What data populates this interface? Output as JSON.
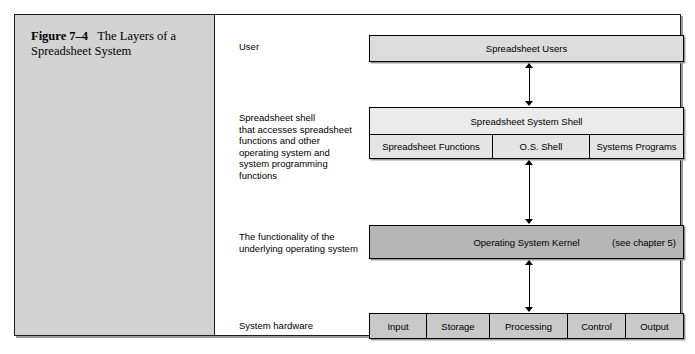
{
  "figure": {
    "label": "Figure 7–4",
    "title": "The Layers of a Spreadsheet System"
  },
  "diagram": {
    "type": "layered-architecture",
    "colors": {
      "caption_panel": "#d3d3d3",
      "user_box": "#dcdcdc",
      "shell_box": "#ebebeb",
      "shell_sub_box": "#e4e4e4",
      "kernel_box": "#b6b6b6",
      "hardware_box": "#c9c9c9",
      "border": "#000000",
      "shadow": "#9a9a9a"
    },
    "layers": [
      {
        "id": "user",
        "side_label": "User",
        "box_label": "Spreadsheet Users",
        "sub_boxes": []
      },
      {
        "id": "shell",
        "side_label": "Spreadsheet shell\nthat accesses spreadsheet\nfunctions and other\noperating system and\nsystem programming\nfunctions",
        "box_label": "Spreadsheet System Shell",
        "sub_boxes": [
          "Spreadsheet Functions",
          "O.S. Shell",
          "Systems Programs"
        ]
      },
      {
        "id": "kernel",
        "side_label": "The functionality of the\nunderlying operating system",
        "box_label": "Operating System Kernel",
        "box_note": "(see chapter 5)",
        "sub_boxes": []
      },
      {
        "id": "hardware",
        "side_label": "System hardware",
        "box_label": "",
        "sub_boxes": [
          "Input",
          "Storage",
          "Processing",
          "Control",
          "Output"
        ]
      }
    ],
    "connectors": [
      {
        "id": "user-shell",
        "from": "user",
        "to": "shell",
        "style": "double-headed-arrow"
      },
      {
        "id": "shell-kernel",
        "from": "shell",
        "to": "kernel",
        "style": "double-headed-arrow"
      },
      {
        "id": "kernel-hardware",
        "from": "kernel",
        "to": "hardware",
        "style": "double-headed-arrow"
      }
    ]
  }
}
